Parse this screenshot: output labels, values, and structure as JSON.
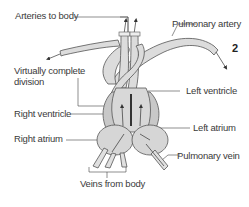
{
  "figure_number": "2",
  "labels": {
    "arteries_to_body": "Arteries to body",
    "pulmonary_artery": "Pulmonary artery",
    "virtually_complete_division_line1": "Virtually complete",
    "virtually_complete_division_line2": "division",
    "left_ventricle": "Left ventricle",
    "right_ventricle": "Right ventricle",
    "left_atrium": "Left atrium",
    "right_atrium": "Right atrium",
    "pulmonary_vein": "Pulmonary vein",
    "veins_from_body": "Veins from body"
  },
  "colors": {
    "fill": "#d9d9d9",
    "stroke": "#555555",
    "line": "#444444"
  }
}
